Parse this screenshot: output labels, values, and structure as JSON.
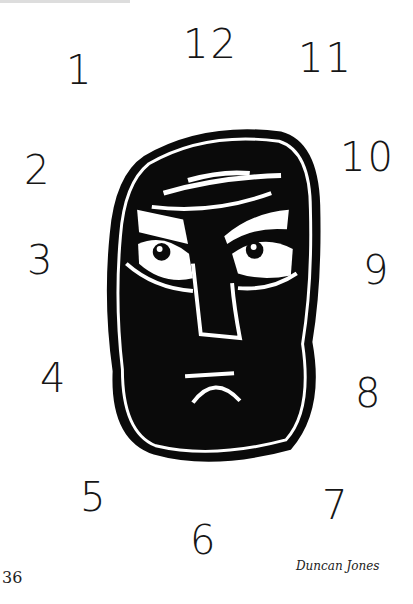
{
  "header": {
    "cut_off_text": ""
  },
  "clock_numbers": [
    {
      "label": "1",
      "x": 66,
      "y": 50
    },
    {
      "label": "12",
      "x": 183,
      "y": 24
    },
    {
      "label": "11",
      "x": 298,
      "y": 38
    },
    {
      "label": "2",
      "x": 24,
      "y": 150
    },
    {
      "label": "10",
      "x": 340,
      "y": 137
    },
    {
      "label": "3",
      "x": 27,
      "y": 240
    },
    {
      "label": "9",
      "x": 363,
      "y": 250
    },
    {
      "label": "4",
      "x": 40,
      "y": 358
    },
    {
      "label": "8",
      "x": 355,
      "y": 373
    },
    {
      "label": "5",
      "x": 80,
      "y": 477
    },
    {
      "label": "7",
      "x": 322,
      "y": 485
    },
    {
      "label": "6",
      "x": 190,
      "y": 520
    }
  ],
  "illustration": {
    "subject": "linocut frowning face",
    "ink": "#0a0a0a",
    "paper": "#ffffff"
  },
  "footer": {
    "page_number": "36",
    "author": "Duncan Jones"
  }
}
